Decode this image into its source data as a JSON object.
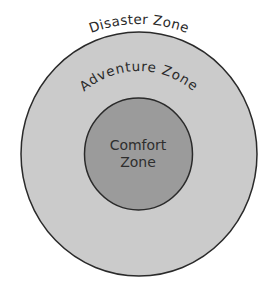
{
  "diagram": {
    "type": "concentric-zones",
    "colors": {
      "background": "#ffffff",
      "outer_fill": "#cbcbcb",
      "inner_fill": "#9b9b9b",
      "stroke": "#2a2a2a",
      "text": "#2e2e2e"
    },
    "outer_label": "Disaster Zone",
    "middle_label": "Adventure Zone",
    "inner_label_line1": "Comfort",
    "inner_label_line2": "Zone"
  }
}
